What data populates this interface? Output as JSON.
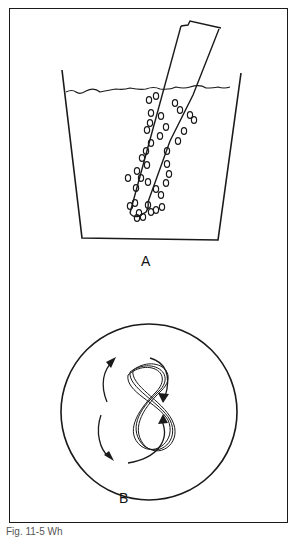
{
  "figure": {
    "panel_a": {
      "label": "A",
      "depicts": "beaker-with-liquid-and-tilted-tube-with-bubbles"
    },
    "panel_b": {
      "label": "B",
      "depicts": "circle-with-figure-eight-and-rotation-arrows"
    },
    "caption": "Fig. 11-5 Wh"
  },
  "colors": {
    "ink": "#1a1a1a",
    "background": "#ffffff"
  }
}
